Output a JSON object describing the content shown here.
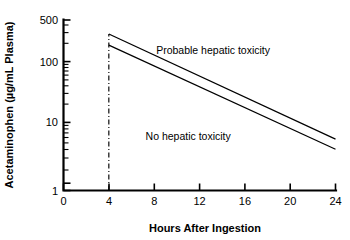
{
  "chart_data": {
    "type": "line",
    "title": "",
    "xlabel": "Hours After Ingestion",
    "ylabel": "Acetaminophen (µg/mL Plasma)",
    "xlim": [
      0,
      24
    ],
    "ylim": [
      1,
      500
    ],
    "yscale": "log",
    "xscale": "linear",
    "grid": false,
    "legend": "none",
    "xticks": [
      0,
      4,
      8,
      12,
      16,
      20,
      24
    ],
    "xtick_labels": [
      "0",
      "4",
      "8",
      "12",
      "16",
      "20",
      "24"
    ],
    "yticks": [
      1,
      10,
      100,
      500
    ],
    "ytick_labels": [
      "1",
      "10",
      "100",
      "500"
    ],
    "yticks_minor": [
      2,
      3,
      4,
      5,
      6,
      7,
      8,
      9,
      20,
      30,
      40,
      50,
      60,
      70,
      80,
      90,
      200,
      300,
      400
    ],
    "series": [
      {
        "name": "upper-treatment-line",
        "x": [
          4,
          24
        ],
        "y": [
          300,
          6.5
        ]
      },
      {
        "name": "lower-treatment-line",
        "x": [
          4,
          24
        ],
        "y": [
          200,
          4.5
        ]
      }
    ],
    "vertical_markers": [
      {
        "name": "four-hour-marker",
        "x": 4,
        "y_from": 1,
        "y_to": 300,
        "style": "dash-dot"
      }
    ],
    "annotations": [
      {
        "name": "probable-toxicity-label",
        "text": "Probable hepatic toxicity",
        "x": 13.2,
        "y": 145
      },
      {
        "name": "no-toxicity-label",
        "text": "No hepatic toxicity",
        "x": 11.0,
        "y": 6.2
      }
    ],
    "colors": {
      "line": "#000000",
      "axis": "#000000",
      "background": "#ffffff",
      "text": "#000000"
    }
  }
}
